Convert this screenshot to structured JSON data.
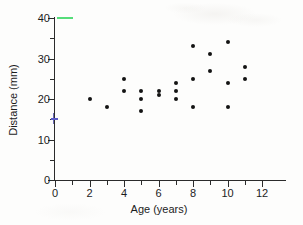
{
  "chart_data": {
    "type": "scatter",
    "title": "",
    "xlabel": "Age (years)",
    "ylabel": "Distance (mm)",
    "xlim": [
      0,
      13
    ],
    "ylim": [
      0,
      42
    ],
    "grid": false,
    "legend": "none",
    "x_major_ticks": [
      0,
      2,
      4,
      6,
      8,
      10,
      12
    ],
    "x_minor_ticks": [
      1,
      3,
      5,
      7,
      9,
      11
    ],
    "x_tick_labels": [
      "0",
      "2",
      "4",
      "6",
      "8",
      "10",
      "12"
    ],
    "y_major_ticks": [
      0,
      10,
      20,
      30,
      40
    ],
    "y_minor_ticks": [
      5,
      15,
      25,
      35
    ],
    "y_tick_labels": [
      "0",
      "10",
      "20",
      "30",
      "40"
    ],
    "x": [
      2,
      3,
      4,
      4,
      5,
      5,
      5,
      6,
      6,
      7,
      7,
      7,
      8,
      8,
      8,
      9,
      9,
      10,
      10,
      10,
      11,
      11
    ],
    "y": [
      20,
      18,
      25,
      22,
      22,
      20,
      17,
      22,
      21,
      24,
      22,
      20,
      33,
      25,
      18,
      31,
      27,
      34,
      24,
      18,
      28,
      25
    ],
    "points": [
      {
        "age": 2,
        "distance": 20
      },
      {
        "age": 3,
        "distance": 18
      },
      {
        "age": 4,
        "distance": 25
      },
      {
        "age": 4,
        "distance": 22
      },
      {
        "age": 5,
        "distance": 22
      },
      {
        "age": 5,
        "distance": 20
      },
      {
        "age": 5,
        "distance": 17
      },
      {
        "age": 6,
        "distance": 22
      },
      {
        "age": 6,
        "distance": 21
      },
      {
        "age": 7,
        "distance": 24
      },
      {
        "age": 7,
        "distance": 22
      },
      {
        "age": 7,
        "distance": 20
      },
      {
        "age": 8,
        "distance": 33
      },
      {
        "age": 8,
        "distance": 25
      },
      {
        "age": 8,
        "distance": 18
      },
      {
        "age": 9,
        "distance": 31
      },
      {
        "age": 9,
        "distance": 27
      },
      {
        "age": 10,
        "distance": 34
      },
      {
        "age": 10,
        "distance": 24
      },
      {
        "age": 10,
        "distance": 18
      },
      {
        "age": 11,
        "distance": 28
      },
      {
        "age": 11,
        "distance": 25
      }
    ],
    "marker_color": "#131313",
    "axis_color": "#2b2b2b",
    "annotations": [
      {
        "name": "green-highlighter-mark",
        "color": "#55dd7a",
        "at_y": 40
      },
      {
        "name": "blue-pen-mark",
        "color": "#5b5bc8",
        "at_y": 15
      }
    ]
  }
}
